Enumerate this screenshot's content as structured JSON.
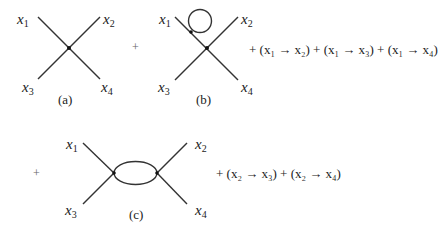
{
  "diagrams": [
    {
      "id": "a",
      "caption": "(a)",
      "labels": [
        "x",
        "x",
        "x",
        "x"
      ],
      "subs": [
        "1",
        "2",
        "3",
        "4"
      ]
    },
    {
      "id": "b",
      "caption": "(b)",
      "labels": [
        "x",
        "x",
        "x",
        "x"
      ],
      "subs": [
        "1",
        "2",
        "3",
        "4"
      ]
    },
    {
      "id": "c",
      "caption": "(c)",
      "labels": [
        "x",
        "x",
        "x",
        "x"
      ],
      "subs": [
        "1",
        "2",
        "3",
        "4"
      ]
    }
  ],
  "operators": {
    "plus1": "+",
    "plus2": "+"
  },
  "permutations_row1": "+ (x₁ → x₂) + (x₁ → x₃) + (x₁ → x₄)",
  "permutations_row2": "+ (x₂ → x₃) + (x₂ → x₄)"
}
